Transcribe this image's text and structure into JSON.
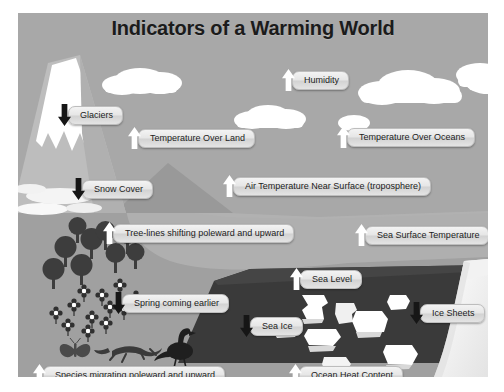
{
  "poster": {
    "title": "Indicators of a Warming World",
    "background_color": "#a8a8a8",
    "land_color": "#9d9d9d",
    "ocean_color": "#3a3a3a",
    "ice_color": "#ffffff",
    "arrow_up_color": "#ffffff",
    "arrow_down_color": "#161616",
    "pill_color": "#e6e6e6",
    "text_color": "#1c1c1c"
  },
  "labels": [
    {
      "id": "glaciers",
      "text": "Glaciers",
      "direction": "down",
      "x": 40,
      "y": 91
    },
    {
      "id": "humidity",
      "text": "Humidity",
      "direction": "up",
      "x": 264,
      "y": 56
    },
    {
      "id": "temperature-land",
      "text": "Temperature Over Land",
      "direction": "up",
      "x": 128,
      "y": 114
    },
    {
      "id": "temperature-oceans",
      "text": "Temperature Over Oceans",
      "direction": "up",
      "x": 337,
      "y": 113
    },
    {
      "id": "snow-cover",
      "text": "Snow Cover",
      "direction": "down",
      "x": 72,
      "y": 165
    },
    {
      "id": "air-temperature",
      "text": "Air Temperature Near Surface (troposphere)",
      "direction": "up",
      "x": 223,
      "y": 162
    },
    {
      "id": "tree-lines",
      "text": "Tree-lines shifting poleward and upward",
      "direction": "up",
      "x": 103,
      "y": 209
    },
    {
      "id": "sea-surface-temp",
      "text": "Sea Surface Temperature",
      "direction": "up",
      "x": 355,
      "y": 211
    },
    {
      "id": "sea-level",
      "text": "Sea Level",
      "direction": "up",
      "x": 290,
      "y": 255
    },
    {
      "id": "spring-earlier",
      "text": "Spring coming earlier",
      "direction": "down",
      "x": 112,
      "y": 279
    },
    {
      "id": "sea-ice",
      "text": "Sea Ice",
      "direction": "down",
      "x": 240,
      "y": 302
    },
    {
      "id": "ice-sheets",
      "text": "Ice Sheets",
      "direction": "down",
      "x": 410,
      "y": 289
    },
    {
      "id": "species-migrating",
      "text": "Species migrating poleward and upward",
      "direction": "up",
      "x": 33,
      "y": 351
    },
    {
      "id": "ocean-heat",
      "text": "Ocean Heat Content",
      "direction": "up",
      "x": 289,
      "y": 351
    }
  ],
  "scene_elements": {
    "mountain": "snow-capped-mountain",
    "clouds": 5,
    "trees": 9,
    "flowers": 12,
    "animals": [
      "butterfly",
      "lizard",
      "bird"
    ],
    "ice_floes": 8,
    "ice_sheet": "right-edge-ice-sheet"
  }
}
